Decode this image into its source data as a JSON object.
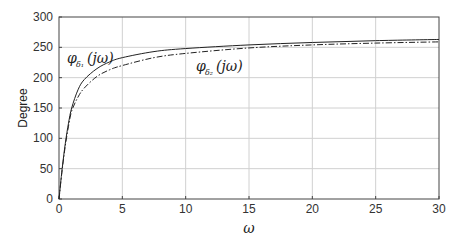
{
  "chart_data": {
    "type": "line",
    "title": "",
    "xlabel": "ω",
    "ylabel": "Degree",
    "xlim": [
      0,
      30
    ],
    "ylim": [
      0,
      300
    ],
    "grid": true,
    "xticks": [
      0,
      5,
      10,
      15,
      20,
      25,
      30
    ],
    "yticks": [
      0,
      50,
      100,
      150,
      200,
      250,
      300
    ],
    "series": [
      {
        "name": "φδ1(jω)",
        "style": "solid",
        "x": [
          0,
          0.25,
          0.5,
          0.75,
          1,
          1.5,
          2,
          3,
          4,
          5,
          7.5,
          10,
          15,
          20,
          25,
          30
        ],
        "values": [
          0,
          50,
          92,
          125,
          150,
          180,
          197,
          215,
          226,
          233,
          243,
          248,
          254,
          258,
          261,
          263
        ]
      },
      {
        "name": "φδ2(jω)",
        "style": "dashdot",
        "x": [
          0,
          0.25,
          0.5,
          0.75,
          1,
          1.5,
          2,
          3,
          4,
          5,
          7.5,
          10,
          15,
          20,
          25,
          30
        ],
        "values": [
          0,
          48,
          88,
          120,
          145,
          168,
          183,
          202,
          213,
          220,
          233,
          240,
          249,
          254,
          257,
          259
        ]
      }
    ],
    "annotations": [
      {
        "text": "φδ1(jω)",
        "x": 1.3,
        "y": 228
      },
      {
        "text": "φδ2(jω)",
        "x": 12.2,
        "y": 215
      }
    ]
  },
  "labels": {
    "ylabel": "Degree",
    "xlabel": "ω",
    "series1_main": "φ",
    "series1_sub": "δ₁",
    "series1_arg": "(jω)",
    "series2_main": "φ",
    "series2_sub": "δ₂",
    "series2_arg": "(jω)"
  }
}
